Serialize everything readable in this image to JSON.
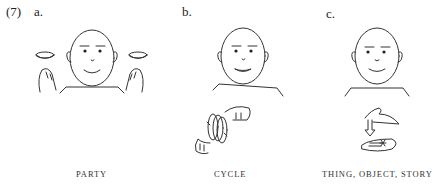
{
  "example_number": "(7)",
  "panels": [
    {
      "letter": "a.",
      "gloss": "PARTY"
    },
    {
      "letter": "b.",
      "gloss": "CYCLE"
    },
    {
      "letter": "c.",
      "gloss": "THING, OBJECT, STORY"
    }
  ]
}
